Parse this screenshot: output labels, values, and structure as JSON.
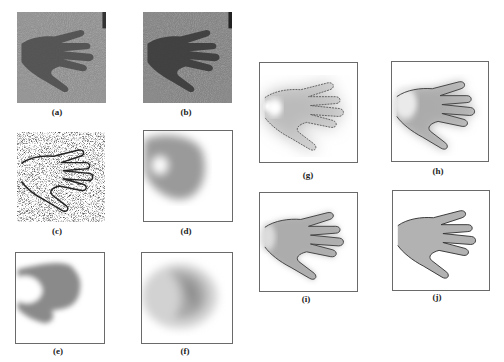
{
  "figure": {
    "panels": [
      {
        "id": "a",
        "label": "(a)",
        "kind": "photo-hand-original"
      },
      {
        "id": "b",
        "label": "(b)",
        "kind": "photo-hand-enhanced"
      },
      {
        "id": "c",
        "label": "(c)",
        "kind": "edge-map-noisy"
      },
      {
        "id": "d",
        "label": "(d)",
        "kind": "blurred-blob"
      },
      {
        "id": "e",
        "label": "(e)",
        "kind": "blurred-blob-dark"
      },
      {
        "id": "f",
        "label": "(f)",
        "kind": "blurred-blob-light"
      },
      {
        "id": "g",
        "label": "(g)",
        "kind": "segmentation-iteration"
      },
      {
        "id": "h",
        "label": "(h)",
        "kind": "segmentation-iteration"
      },
      {
        "id": "i",
        "label": "(i)",
        "kind": "segmentation-iteration"
      },
      {
        "id": "j",
        "label": "(j)",
        "kind": "segmentation-final"
      }
    ]
  }
}
